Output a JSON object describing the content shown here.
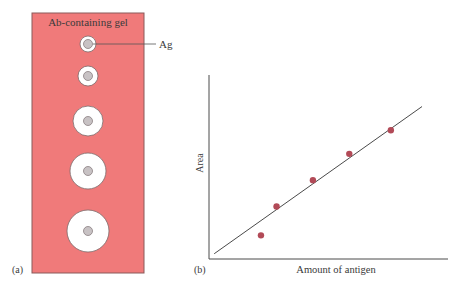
{
  "panel_a": {
    "label": "(a)",
    "gel_title": "Ab-containing gel",
    "antigen_callout": "Ag",
    "colors": {
      "gel_fill": "#f07a7a",
      "gel_border": "#8a5a5a",
      "precipitin_ring": "#ffffff",
      "well_fill": "#c8c2c4",
      "well_border": "#8a7f82"
    },
    "wells": [
      {
        "cx": 88,
        "cy": 44,
        "ring_r": 8,
        "well_r": 4.5
      },
      {
        "cx": 88,
        "cy": 76,
        "ring_r": 10,
        "well_r": 4.5
      },
      {
        "cx": 88,
        "cy": 121,
        "ring_r": 15,
        "well_r": 4.5
      },
      {
        "cx": 88,
        "cy": 171,
        "ring_r": 18,
        "well_r": 4.5
      },
      {
        "cx": 88,
        "cy": 231,
        "ring_r": 21,
        "well_r": 4.5
      }
    ]
  },
  "panel_b": {
    "label": "(b)",
    "colors": {
      "axis": "#4a4a4a",
      "fit_line": "#4a4a4a",
      "point": "#b24a57"
    }
  },
  "chart_data": {
    "type": "scatter",
    "title": "",
    "xlabel": "Amount of antigen",
    "ylabel": "Area",
    "grid": false,
    "legend": null,
    "x_ticks": [],
    "y_ticks": [],
    "points": [
      {
        "x": 1.0,
        "y": 0.9
      },
      {
        "x": 1.3,
        "y": 2.0
      },
      {
        "x": 2.0,
        "y": 3.0
      },
      {
        "x": 2.7,
        "y": 4.0
      },
      {
        "x": 3.5,
        "y": 4.9
      }
    ],
    "fit_line": {
      "x0": 0.1,
      "y0": 0.2,
      "x1": 4.1,
      "y1": 5.8
    },
    "xlim": [
      0,
      4.6
    ],
    "ylim": [
      0,
      7.0
    ],
    "annotation": "Linear fit through data points (radial immunodiffusion calibration)"
  }
}
